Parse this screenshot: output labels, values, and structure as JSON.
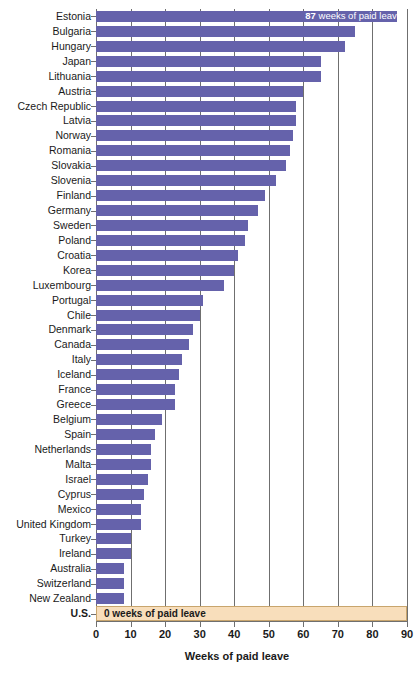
{
  "chart_data": {
    "type": "bar",
    "orientation": "horizontal",
    "title": "",
    "subtitle": "",
    "xlabel": "Weeks of paid leave",
    "ylabel": "",
    "xlim": [
      0,
      90
    ],
    "xticks": [
      0,
      10,
      20,
      30,
      40,
      50,
      60,
      70,
      80,
      90
    ],
    "xticklabels": [
      "0",
      "10",
      "20",
      "30",
      "40",
      "50",
      "60",
      "70",
      "80",
      "90"
    ],
    "grid": "vertical",
    "legend": null,
    "bar_color": "#6562AB",
    "highlight_color": "#F8DEBB",
    "highlight_border_color": "#C8A56D",
    "categories": [
      "Estonia",
      "Bulgaria",
      "Hungary",
      "Japan",
      "Lithuania",
      "Austria",
      "Czech Republic",
      "Latvia",
      "Norway",
      "Romania",
      "Slovakia",
      "Slovenia",
      "Finland",
      "Germany",
      "Sweden",
      "Poland",
      "Croatia",
      "Korea",
      "Luxembourg",
      "Portugal",
      "Chile",
      "Denmark",
      "Canada",
      "Italy",
      "Iceland",
      "France",
      "Greece",
      "Belgium",
      "Spain",
      "Netherlands",
      "Malta",
      "Israel",
      "Cyprus",
      "Mexico",
      "United Kingdom",
      "Turkey",
      "Ireland",
      "Australia",
      "Switzerland",
      "New Zealand",
      "U.S."
    ],
    "values": [
      87,
      75,
      72,
      65,
      65,
      60,
      58,
      58,
      57,
      56,
      55,
      52,
      49,
      47,
      44,
      43,
      41,
      40,
      37,
      31,
      30,
      28,
      27,
      25,
      24,
      23,
      23,
      19,
      17,
      16,
      16,
      15,
      14,
      13,
      13,
      10,
      10,
      8,
      8,
      8,
      0
    ],
    "annotations": [
      {
        "category": "Estonia",
        "value": 87,
        "bold_prefix": "87",
        "text": " weeks of paid leave",
        "style": "inside-bar-white"
      },
      {
        "category": "U.S.",
        "value": 0,
        "bold_prefix": "0",
        "text": " weeks of paid leave",
        "style": "highlight-band-dark"
      }
    ],
    "emphasized_categories": [
      "U.S."
    ]
  }
}
